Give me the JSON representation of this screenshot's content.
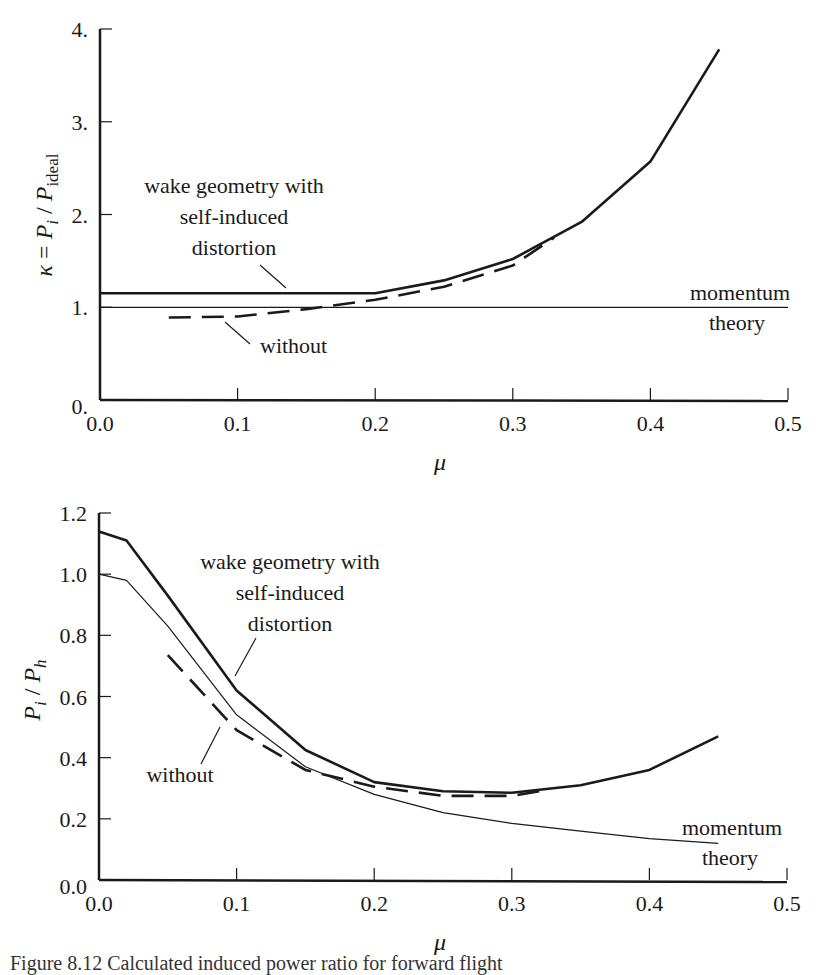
{
  "chart_data": [
    {
      "type": "line",
      "id": "top",
      "title": "",
      "xlabel": "μ",
      "ylabel": "κ = P_i / P_ideal",
      "xlim": [
        0.0,
        0.5
      ],
      "ylim": [
        0.0,
        4.0
      ],
      "x_ticks": [
        "0.0",
        "0.1",
        "0.2",
        "0.3",
        "0.4",
        "0.5"
      ],
      "y_ticks": [
        "0.",
        "1.",
        "2.",
        "3.",
        "4."
      ],
      "grid": false,
      "series": [
        {
          "name": "wake geometry with self-induced distortion",
          "style": "solid-thick",
          "x": [
            0.0,
            0.2,
            0.25,
            0.3,
            0.35,
            0.4,
            0.45
          ],
          "y": [
            1.15,
            1.15,
            1.29,
            1.52,
            1.92,
            2.57,
            3.78
          ]
        },
        {
          "name": "without",
          "style": "dashed",
          "x": [
            0.05,
            0.1,
            0.15,
            0.2,
            0.25,
            0.3,
            0.33
          ],
          "y": [
            0.89,
            0.9,
            0.98,
            1.08,
            1.22,
            1.45,
            1.75
          ]
        },
        {
          "name": "momentum theory",
          "style": "solid-thin",
          "x": [
            0.0,
            0.5
          ],
          "y": [
            1.0,
            1.0
          ]
        }
      ],
      "annotations": [
        {
          "text": [
            "wake geometry with",
            "self-induced",
            "distortion"
          ]
        },
        {
          "text": [
            "without"
          ]
        },
        {
          "text": [
            "momentum",
            "theory"
          ]
        }
      ]
    },
    {
      "type": "line",
      "id": "bottom",
      "title": "",
      "xlabel": "μ",
      "ylabel": "P_i / P_h",
      "xlim": [
        0.0,
        0.5
      ],
      "ylim": [
        0.0,
        1.2
      ],
      "x_ticks": [
        "0.0",
        "0.1",
        "0.2",
        "0.3",
        "0.4",
        "0.5"
      ],
      "y_ticks": [
        "0.0",
        "0.2",
        "0.4",
        "0.6",
        "0.8",
        "1.0",
        "1.2"
      ],
      "grid": false,
      "series": [
        {
          "name": "wake geometry with self-induced distortion",
          "style": "solid-thick",
          "x": [
            0.0,
            0.02,
            0.05,
            0.1,
            0.15,
            0.2,
            0.25,
            0.3,
            0.35,
            0.4,
            0.45
          ],
          "y": [
            1.14,
            1.11,
            0.93,
            0.62,
            0.425,
            0.32,
            0.29,
            0.285,
            0.31,
            0.36,
            0.47
          ]
        },
        {
          "name": "without",
          "style": "dashed",
          "x": [
            0.05,
            0.1,
            0.15,
            0.2,
            0.25,
            0.3,
            0.32
          ],
          "y": [
            0.735,
            0.49,
            0.36,
            0.305,
            0.275,
            0.275,
            0.29
          ]
        },
        {
          "name": "momentum theory",
          "style": "solid-thin",
          "x": [
            0.0,
            0.02,
            0.05,
            0.1,
            0.15,
            0.2,
            0.25,
            0.3,
            0.35,
            0.4,
            0.45
          ],
          "y": [
            1.0,
            0.98,
            0.83,
            0.54,
            0.37,
            0.28,
            0.22,
            0.185,
            0.16,
            0.135,
            0.12
          ]
        }
      ],
      "annotations": [
        {
          "text": [
            "wake geometry with",
            "self-induced",
            "distortion"
          ]
        },
        {
          "text": [
            "without"
          ]
        },
        {
          "text": [
            "momentum",
            "theory"
          ]
        }
      ]
    }
  ],
  "caption": "Figure 8.12  Calculated induced power ratio for forward flight"
}
